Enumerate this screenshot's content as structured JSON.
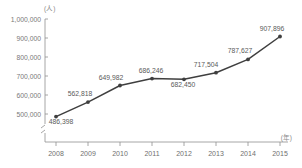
{
  "chart_data": {
    "type": "line",
    "title": "",
    "xlabel": "(年)",
    "ylabel": "(人)",
    "categories": [
      "2008",
      "2009",
      "2010",
      "2011",
      "2012",
      "2013",
      "2014",
      "2015"
    ],
    "values": [
      486398,
      562818,
      649982,
      686246,
      682450,
      717504,
      787627,
      907896
    ],
    "value_labels": [
      "486,398",
      "562,818",
      "649,982",
      "686,246",
      "682,450",
      "717,504",
      "787,627",
      "907,896"
    ],
    "yticks": [
      500000,
      600000,
      700000,
      800000,
      900000,
      1000000
    ],
    "ytick_labels": [
      "500,000",
      "600,000",
      "700,000",
      "800,000",
      "900,000",
      "1,000,000"
    ],
    "ylim": [
      460000,
      1000000
    ],
    "axis_break": true,
    "grid": false,
    "legend": "none",
    "series_color": "#3f3f3f",
    "axis_color": "#8f8f8f"
  },
  "axes": {
    "y_unit": "(人)",
    "x_unit": "(年)"
  }
}
